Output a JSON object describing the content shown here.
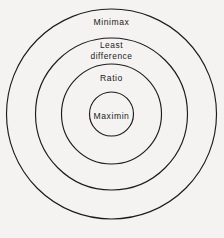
{
  "figure": {
    "kind": "concentric-circles-diagram",
    "width": 224,
    "height": 238,
    "background_color": "#f4f3f1",
    "stroke_color": "#1c1c1c",
    "text_color": "#1a1a1a",
    "center_x": 111.5,
    "center_y": 114
  },
  "chart_data": {
    "type": "diagram",
    "subtype": "concentric-circles",
    "title": "",
    "xlabel": "",
    "ylabel": "",
    "center": [
      111.5,
      114
    ],
    "rings": [
      {
        "label": "Minimax",
        "lines": [
          "Minimax"
        ],
        "radius": 105,
        "level": 1,
        "label_y": 23
      },
      {
        "label": "Least difference",
        "lines": [
          "Least",
          "difference"
        ],
        "radius": 76,
        "level": 2,
        "label_y": 51
      },
      {
        "label": "Ratio",
        "lines": [
          "Ratio"
        ],
        "radius": 50,
        "level": 3,
        "label_y": 79
      },
      {
        "label": "Maximin",
        "lines": [
          "Maximin"
        ],
        "radius": 22,
        "level": 4,
        "label_y": 117
      }
    ]
  }
}
